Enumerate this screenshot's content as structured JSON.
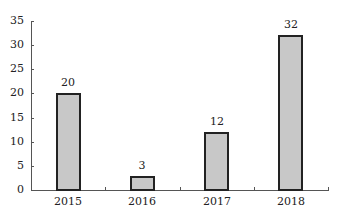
{
  "chart_data": {
    "type": "bar",
    "title": "",
    "xlabel": "",
    "ylabel": "",
    "categories": [
      "2015",
      "2016",
      "2017",
      "2018"
    ],
    "values": [
      20,
      3,
      12,
      32
    ],
    "data_labels": [
      "20",
      "3",
      "12",
      "32"
    ],
    "ylim": [
      0,
      35
    ],
    "yticks": [
      0,
      5,
      10,
      15,
      20,
      25,
      30,
      35
    ],
    "ytick_labels": [
      "0",
      "5",
      "10",
      "15",
      "20",
      "25",
      "30",
      "35"
    ],
    "grid": false,
    "legend": null,
    "colors": {
      "bar_fill": "#c8c8c8",
      "bar_border": "#222222",
      "axis": "#555555"
    }
  }
}
